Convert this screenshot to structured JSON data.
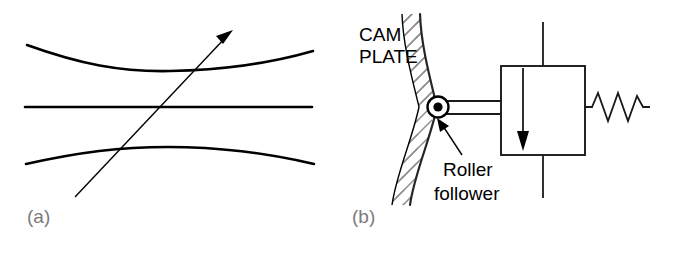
{
  "figure": {
    "panels": [
      {
        "id": "a",
        "label": "(a)",
        "kind": "ray-through-curved-gap",
        "elements": {
          "top_curve": "concave-up-curve",
          "center_line": "horizontal-straight-line",
          "bottom_curve": "convex-up-curve",
          "ray": "arrow-up-right"
        }
      },
      {
        "id": "b",
        "label": "(b)",
        "kind": "cam-plate-roller-follower-mass-spring",
        "labels": {
          "cam_line1": "CAM",
          "cam_line2": "PLATE",
          "roller_line1": "Roller",
          "roller_line2": "follower"
        },
        "elements": {
          "cam_plate": "hatched-vertical-band",
          "roller": "circle-with-center-dot",
          "rod": "horizontal-connecting-rod",
          "mass_block": "rectangle",
          "guide_rail": "vertical-line",
          "motion_arrow": "down-arrow",
          "spring": "zigzag-spring",
          "pointer": "callout-arrow"
        }
      }
    ]
  },
  "colors": {
    "ink": "#000000",
    "label_gray": "#7b7b7b",
    "hatch_gray": "#8d8d8d",
    "background": "#ffffff"
  }
}
